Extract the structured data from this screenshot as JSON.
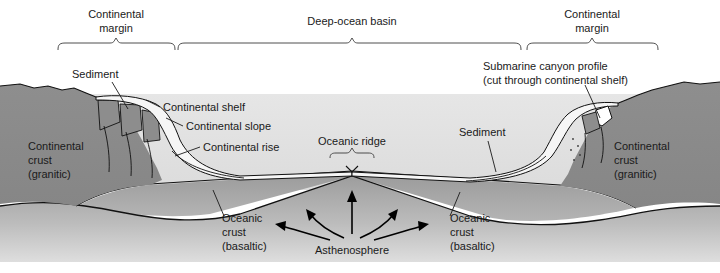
{
  "figure": {
    "title_semantic": "ocean-basin-cross-section",
    "colors": {
      "background": "#ffffff",
      "water": "#e3e3e3",
      "continental_crust": "#8d8d8d",
      "oceanic_crust": "#8a8a8a",
      "asthenosphere": "#b6b6b6",
      "sediment": "#f4f4f4",
      "outline": "#111111",
      "text": "#1a1a1a"
    }
  },
  "brackets": [
    {
      "id": "continental-margin-left",
      "label_line1": "Continental",
      "label_line2": "margin",
      "x_start": 58,
      "x_end": 175,
      "x_center": 116,
      "y": 46
    },
    {
      "id": "deep-ocean-basin",
      "label_line1": "Deep-ocean basin",
      "label_line2": "",
      "x_start": 178,
      "x_end": 521,
      "x_center": 352,
      "y": 46
    },
    {
      "id": "continental-margin-right",
      "label_line1": "Continental",
      "label_line2": "margin",
      "x_start": 527,
      "x_end": 658,
      "x_center": 592,
      "y": 46
    }
  ],
  "labels": {
    "sediment_left": "Sediment",
    "sediment_right": "Sediment",
    "continental_shelf": "Continental shelf",
    "continental_slope": "Continental slope",
    "continental_rise": "Continental rise",
    "oceanic_ridge": "Oceanic ridge",
    "submarine_canyon_line1": "Submarine canyon profile",
    "submarine_canyon_line2": "(cut through continental shelf)",
    "continental_crust_left_line1": "Continental",
    "continental_crust_left_line2": "crust",
    "continental_crust_left_line3": "(granitic)",
    "continental_crust_right_line1": "Continental",
    "continental_crust_right_line2": "crust",
    "continental_crust_right_line3": "(granitic)",
    "oceanic_crust_left_line1": "Oceanic",
    "oceanic_crust_left_line2": "crust",
    "oceanic_crust_left_line3": "(basaltic)",
    "oceanic_crust_right_line1": "Oceanic",
    "oceanic_crust_right_line2": "crust",
    "oceanic_crust_right_line3": "(basaltic)",
    "asthenosphere": "Asthenosphere"
  }
}
